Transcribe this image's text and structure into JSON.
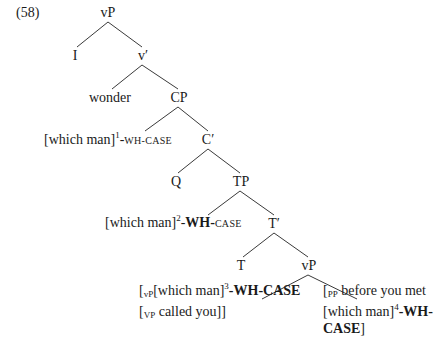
{
  "example_number": "(58)",
  "tree": {
    "root": "vP",
    "I": "I",
    "v_bar": "v′",
    "wonder": "wonder",
    "CP": "CP",
    "spec_cp": {
      "bracket": "[which man]",
      "index": "1",
      "dash": "-",
      "wh": "WH-",
      "case": "CASE"
    },
    "C_bar": "C′",
    "Q": "Q",
    "TP": "TP",
    "spec_tp": {
      "bracket": "[which man]",
      "index": "2",
      "dash": "-",
      "wh": "WH-",
      "case": "CASE"
    },
    "T_bar": "T′",
    "T": "T",
    "vP_low": "vP",
    "left_leaf": {
      "open": "[",
      "label1": "vP",
      "text1": "[which man]",
      "index": "3",
      "feature": "-WH-CASE",
      "line2_open": "[",
      "label2": "VP",
      "text2": " called you]]"
    },
    "right_leaf": {
      "open": "[",
      "label": "PP",
      "text1": " before you met",
      "text2": "[which man]",
      "index": "4",
      "feature1": "-WH-",
      "feature2": "CASE",
      "close": "]"
    }
  }
}
